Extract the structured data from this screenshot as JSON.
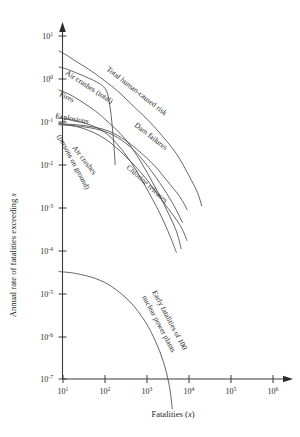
{
  "chart_data": {
    "type": "line",
    "title": "",
    "xlabel": "Fatalities (x)",
    "ylabel": "Annual rate of fatalities exceeding x",
    "xscale": "log",
    "yscale": "log",
    "xlim": [
      10,
      1000000
    ],
    "ylim": [
      1e-07,
      10
    ],
    "grid": false,
    "legend": "inline-curve-labels",
    "xticks": [
      "10",
      "10",
      "10",
      "10",
      "10",
      "10"
    ],
    "xtick_exponents": [
      "1",
      "2",
      "3",
      "4",
      "5",
      "6"
    ],
    "xtick_values": [
      10,
      100,
      1000,
      10000,
      100000,
      1000000
    ],
    "yticks": [
      "10",
      "10",
      "10",
      "10",
      "10",
      "10",
      "10",
      "10",
      "10"
    ],
    "ytick_exponents": [
      "1",
      "0",
      "-1",
      "-2",
      "-3",
      "-4",
      "-5",
      "-6",
      "-7"
    ],
    "ytick_values": [
      10,
      1,
      0.1,
      0.01,
      0.001,
      0.0001,
      1e-05,
      1e-06,
      1e-07
    ],
    "series": [
      {
        "name": "Total human-caused risk",
        "label": "Total human-caused risk",
        "points": [
          [
            8,
            4.5
          ],
          [
            12,
            3.6
          ],
          [
            20,
            2.6
          ],
          [
            40,
            1.7
          ],
          [
            80,
            1.05
          ],
          [
            200,
            0.52
          ],
          [
            500,
            0.22
          ],
          [
            1000,
            0.115
          ],
          [
            2000,
            0.055
          ],
          [
            5000,
            0.018
          ],
          [
            10000,
            0.0055
          ],
          [
            16000,
            0.0022
          ],
          [
            20000,
            0.0011
          ]
        ]
      },
      {
        "name": "Air crashes (total)",
        "label": "Air crashes (total)",
        "points": [
          [
            8,
            1.9
          ],
          [
            12,
            1.7
          ],
          [
            20,
            1.4
          ],
          [
            40,
            1.05
          ],
          [
            70,
            0.8
          ],
          [
            100,
            0.6
          ],
          [
            120,
            0.38
          ],
          [
            140,
            0.14
          ],
          [
            160,
            0.035
          ],
          [
            175,
            0.01
          ]
        ]
      },
      {
        "name": "Fires",
        "label": "Fires",
        "points": [
          [
            8,
            0.55
          ],
          [
            12,
            0.47
          ],
          [
            20,
            0.36
          ],
          [
            50,
            0.2
          ],
          [
            100,
            0.115
          ],
          [
            300,
            0.04
          ],
          [
            700,
            0.012
          ],
          [
            1500,
            0.0032
          ],
          [
            3000,
            0.00085
          ],
          [
            5000,
            0.00028
          ],
          [
            6500,
            0.00011
          ]
        ]
      },
      {
        "name": "Explosions",
        "label": "Explosions",
        "points": [
          [
            8,
            0.125
          ],
          [
            20,
            0.105
          ],
          [
            60,
            0.075
          ],
          [
            150,
            0.04
          ],
          [
            400,
            0.012
          ],
          [
            900,
            0.0032
          ],
          [
            2000,
            0.00075
          ],
          [
            3500,
            0.00022
          ],
          [
            5000,
            9e-05
          ]
        ]
      },
      {
        "name": "Air crashes (persons on ground)",
        "label": "Air crashes (persons on ground)",
        "points": [
          [
            8,
            0.085
          ],
          [
            20,
            0.08
          ],
          [
            60,
            0.068
          ],
          [
            150,
            0.05
          ],
          [
            400,
            0.026
          ],
          [
            900,
            0.011
          ],
          [
            2000,
            0.0038
          ],
          [
            4000,
            0.0013
          ],
          [
            7000,
            0.00045
          ]
        ]
      },
      {
        "name": "Dam failures",
        "label": "Dam failures",
        "points": [
          [
            8,
            0.09
          ],
          [
            30,
            0.082
          ],
          [
            100,
            0.065
          ],
          [
            250,
            0.042
          ],
          [
            600,
            0.022
          ],
          [
            1500,
            0.0095
          ],
          [
            3000,
            0.0042
          ],
          [
            6000,
            0.0018
          ],
          [
            9000,
            0.0009
          ]
        ]
      },
      {
        "name": "Chlorine releases",
        "label": "Chlorine releases",
        "points": [
          [
            8,
            0.092
          ],
          [
            30,
            0.07
          ],
          [
            100,
            0.04
          ],
          [
            300,
            0.016
          ],
          [
            900,
            0.005
          ],
          [
            2500,
            0.0013
          ],
          [
            6000,
            0.0004
          ],
          [
            9000,
            0.00017
          ]
        ]
      },
      {
        "name": "Early fatalities of 100 nuclear power plants",
        "label": "Early fatalities of 100 nuclear power plants",
        "points": [
          [
            8,
            3.2e-05
          ],
          [
            20,
            2.9e-05
          ],
          [
            60,
            2.2e-05
          ],
          [
            150,
            1.4e-05
          ],
          [
            400,
            6.2e-06
          ],
          [
            900,
            2.2e-06
          ],
          [
            1600,
            7.5e-07
          ],
          [
            2500,
            2.4e-07
          ],
          [
            3400,
            7e-08
          ],
          [
            4000,
            2e-08
          ]
        ]
      }
    ]
  },
  "axes": {
    "x_title": "Fatalities (x)",
    "x_title_plain": "Fatalities (",
    "x_title_italic": "x",
    "x_title_close": ")",
    "y_title_plain": "Annual rate of fatalities exceeding ",
    "y_title_italic": "x"
  },
  "labels": {
    "air_crashes_total": "Air crashes (total)",
    "fires": "Fires",
    "explosions": "Explosions",
    "air_crashes_ground_line1": "Air crashes",
    "air_crashes_ground_line2": "(persons on ground)",
    "total_human_caused_risk": "Total human-caused risk",
    "dam_failures": "Dam failures",
    "chlorine_releases": "Chlorine releases",
    "nuclear_line1": "Early fatalities of 100",
    "nuclear_line2": "nuclear power plants"
  },
  "colors": {
    "background": "#ffffff",
    "axis": "#3a3a3a",
    "curve": "#4a4a4a",
    "text": "#1f1f1f"
  }
}
